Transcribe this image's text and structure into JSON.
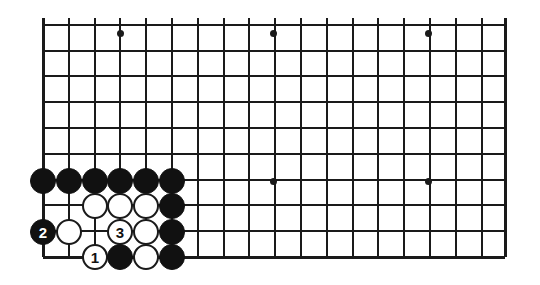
{
  "figure": {
    "type": "go-board-diagram",
    "title": "",
    "caption": "",
    "board": {
      "grid_spacing": 25.8,
      "left_edge_x": 43,
      "right_edge_x": 505,
      "bottom_edge_y": 257,
      "top_crop_y": 18,
      "columns": 19,
      "visible_rows": 10,
      "line_color": "#1a1a1a",
      "background_color": "#ffffff"
    },
    "star_points": [
      {
        "x": 120,
        "y": 33
      },
      {
        "x": 273,
        "y": 33
      },
      {
        "x": 428,
        "y": 33
      },
      {
        "x": 273,
        "y": 181
      },
      {
        "x": 428,
        "y": 181
      }
    ],
    "stones": [
      {
        "color": "black",
        "label": "",
        "x": 43,
        "y": 181
      },
      {
        "color": "black",
        "label": "",
        "x": 69,
        "y": 181
      },
      {
        "color": "black",
        "label": "",
        "x": 95,
        "y": 181
      },
      {
        "color": "black",
        "label": "",
        "x": 120,
        "y": 181
      },
      {
        "color": "black",
        "label": "",
        "x": 146,
        "y": 181
      },
      {
        "color": "black",
        "label": "",
        "x": 172,
        "y": 181
      },
      {
        "color": "white",
        "label": "",
        "x": 95,
        "y": 206
      },
      {
        "color": "white",
        "label": "",
        "x": 120,
        "y": 206
      },
      {
        "color": "white",
        "label": "",
        "x": 146,
        "y": 206
      },
      {
        "color": "black",
        "label": "",
        "x": 172,
        "y": 206
      },
      {
        "color": "black",
        "label": "2",
        "x": 43,
        "y": 232
      },
      {
        "color": "white",
        "label": "",
        "x": 69,
        "y": 232
      },
      {
        "color": "white",
        "label": "3",
        "x": 120,
        "y": 232
      },
      {
        "color": "white",
        "label": "",
        "x": 146,
        "y": 232
      },
      {
        "color": "black",
        "label": "",
        "x": 172,
        "y": 232
      },
      {
        "color": "white",
        "label": "1",
        "x": 95,
        "y": 257
      },
      {
        "color": "black",
        "label": "",
        "x": 120,
        "y": 257
      },
      {
        "color": "white",
        "label": "",
        "x": 146,
        "y": 257
      },
      {
        "color": "black",
        "label": "",
        "x": 172,
        "y": 257
      }
    ],
    "move_numbers": [
      {
        "number": "1",
        "color": "white"
      },
      {
        "number": "2",
        "color": "black"
      },
      {
        "number": "3",
        "color": "white"
      }
    ]
  }
}
